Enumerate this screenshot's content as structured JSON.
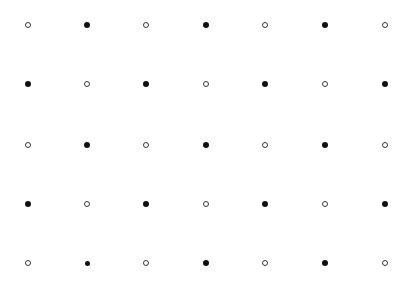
{
  "canvas": {
    "width": 415,
    "height": 281,
    "background": "#ffffff"
  },
  "colors": {
    "filled": "#111111",
    "open_stroke": "#3a3a3a",
    "open_fill": "#ffffff"
  },
  "grid": {
    "columns_x": [
      28,
      87,
      146,
      206,
      265,
      325,
      385
    ],
    "rows_y": [
      25,
      84,
      145,
      204,
      263
    ],
    "rows": [
      [
        "open",
        "filled",
        "open",
        "filled",
        "open",
        "filled",
        "open"
      ],
      [
        "filled",
        "open",
        "filled",
        "open",
        "filled",
        "open",
        "filled"
      ],
      [
        "open",
        "filled",
        "open",
        "filled",
        "open",
        "filled",
        "open"
      ],
      [
        "filled",
        "open",
        "filled",
        "open",
        "filled",
        "open",
        "filled"
      ],
      [
        "open",
        "filled-small",
        "open",
        "filled",
        "open",
        "filled",
        "open"
      ]
    ]
  }
}
